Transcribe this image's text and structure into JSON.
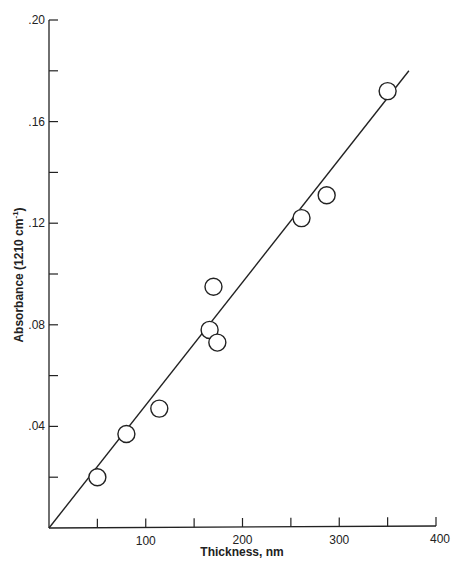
{
  "chart_data": {
    "type": "scatter",
    "title": "",
    "xlabel": "Thickness, nm",
    "ylabel": "Absorbance (1210 cm-1)",
    "ylabel_parts": {
      "main": "Absorbance (1210 cm",
      "sup": "-1",
      "end": ")"
    },
    "xlim": [
      0,
      400
    ],
    "ylim": [
      0,
      0.2
    ],
    "x_ticks": [
      0,
      50,
      100,
      150,
      200,
      250,
      300,
      350,
      400
    ],
    "x_tick_labels": [
      "",
      "",
      "100",
      "",
      "200",
      "",
      "300",
      "",
      "400"
    ],
    "y_ticks": [
      0,
      0.02,
      0.04,
      0.06,
      0.08,
      0.1,
      0.12,
      0.14,
      0.16,
      0.18,
      0.2
    ],
    "y_tick_labels": [
      "",
      "",
      ".04",
      "",
      ".08",
      "",
      ".12",
      "",
      ".16",
      "",
      ".20"
    ],
    "grid": false,
    "legend": null,
    "series": [
      {
        "name": "Measured",
        "marker": "open-circle",
        "x": [
          50,
          80,
          114,
          166,
          170,
          174,
          261,
          287,
          350
        ],
        "y": [
          0.02,
          0.037,
          0.047,
          0.078,
          0.095,
          0.073,
          0.122,
          0.131,
          0.172
        ]
      },
      {
        "name": "Linear fit",
        "type": "line",
        "x": [
          0,
          372
        ],
        "y": [
          0,
          0.18
        ]
      }
    ],
    "colors": {
      "ink": "#222222",
      "background": "#ffffff"
    }
  }
}
